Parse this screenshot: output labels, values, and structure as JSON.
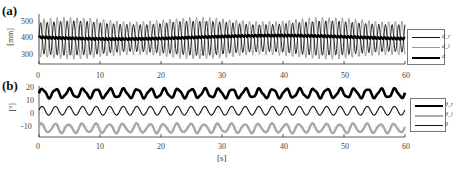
{
  "panels": {
    "a": {
      "label": "(a)",
      "ylabel": "[mm]",
      "yticks": [
        "500",
        "400",
        "300"
      ],
      "xticks": [
        "0",
        "10",
        "20",
        "30",
        "40",
        "50",
        "60"
      ],
      "legend": [
        "d_r",
        "d_l",
        "d"
      ]
    },
    "b": {
      "label": "(b)",
      "ylabel": "[°]",
      "yticks": [
        "20",
        "10",
        "0",
        "-10"
      ],
      "xticks": [
        "0",
        "10",
        "20",
        "30",
        "40",
        "50",
        "60"
      ],
      "legend": [
        "θ_r",
        "θ_l",
        "θ"
      ],
      "xlabel": "[s]"
    }
  },
  "chart_data": [
    {
      "type": "line",
      "title": "(a)",
      "xlabel": "",
      "ylabel": "[mm]",
      "xlim": [
        0,
        60
      ],
      "ylim": [
        270,
        560
      ],
      "yticks": [
        300,
        400,
        500
      ],
      "xticks": [
        0,
        10,
        20,
        30,
        40,
        50,
        60
      ],
      "grid": "dotted horizontal",
      "legend_position": "right outside",
      "series": [
        {
          "name": "d_r",
          "style": "thin black",
          "description": "oscillation ~1 Hz, range ~330-510 mm",
          "x": [
            0,
            10,
            20,
            30,
            40,
            50,
            60
          ],
          "mean": 420,
          "amplitude": 90
        },
        {
          "name": "d_l",
          "style": "gray",
          "description": "oscillation ~1 Hz in antiphase to d_r, range ~300-540 mm",
          "x": [
            0,
            10,
            20,
            30,
            40,
            50,
            60
          ],
          "mean": 420,
          "amplitude": 110
        },
        {
          "name": "d",
          "style": "thick black",
          "description": "mean distance, ~400-440 mm with small ripple",
          "x": [
            0,
            10,
            20,
            30,
            40,
            50,
            60
          ],
          "values": [
            440,
            430,
            420,
            410,
            420,
            415,
            420
          ]
        }
      ]
    },
    {
      "type": "line",
      "title": "(b)",
      "xlabel": "[s]",
      "ylabel": "[°]",
      "xlim": [
        0,
        60
      ],
      "ylim": [
        -15,
        20
      ],
      "yticks": [
        -10,
        0,
        10,
        20
      ],
      "xticks": [
        0,
        10,
        20,
        30,
        40,
        50,
        60
      ],
      "grid": "dotted horizontal",
      "legend_position": "right outside",
      "series": [
        {
          "name": "θ_r",
          "style": "thick black",
          "mean": 15,
          "amplitude": 3
        },
        {
          "name": "θ_l",
          "style": "gray",
          "mean": -9,
          "amplitude": 3
        },
        {
          "name": "θ",
          "style": "thin black",
          "mean": 3,
          "amplitude": 3
        }
      ]
    }
  ]
}
